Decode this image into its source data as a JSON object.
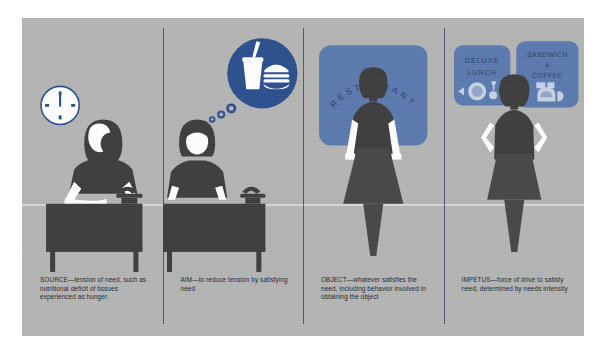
{
  "figure": {
    "background_color": "#b4b4b4",
    "accent_blue": "#2b4f8e",
    "panel_blue": "#5a79ad",
    "figure_dark": "#3d3d3d",
    "divider_color": "#3a4a63"
  },
  "panels": [
    {
      "id": "source",
      "term": "SOURCE",
      "caption": "SOURCE—tension of need, such as nutritional deficit of tissues experienced as hunger.",
      "art": {
        "name": "worker-at-desk-with-clock",
        "elements": [
          "clock-icon",
          "person-seated",
          "desk",
          "telephone"
        ],
        "clock_time": "12:00"
      }
    },
    {
      "id": "aim",
      "term": "AIM",
      "caption": "AIM—to reduce tension by satisfying need",
      "art": {
        "name": "worker-thinking-of-food",
        "elements": [
          "thought-bubble",
          "soda-cup-icon",
          "hamburger-icon",
          "person-seated",
          "desk",
          "telephone"
        ]
      }
    },
    {
      "id": "object",
      "term": "OBJECT",
      "caption": "OBJECT—whatever satisfies the need, including behavior involved in obtaining the object",
      "art": {
        "name": "woman-before-restaurant-sign",
        "sign_text": "RESTAURANT",
        "elements": [
          "restaurant-sign",
          "person-standing"
        ]
      }
    },
    {
      "id": "impetus",
      "term": "IMPETUS",
      "caption": "IMPETUS—force of drive to satisfy need, determined by needs intensity",
      "art": {
        "name": "woman-before-menu-signs",
        "sign_left_line1": "DELUXE",
        "sign_left_line2": "LUNCH",
        "sign_right_line1": "SANDWICH",
        "sign_right_line2": "&",
        "sign_right_line3": "COFFEE",
        "elements": [
          "deluxe-lunch-sign",
          "sandwich-coffee-sign",
          "person-standing-hands-on-hips"
        ]
      }
    }
  ]
}
